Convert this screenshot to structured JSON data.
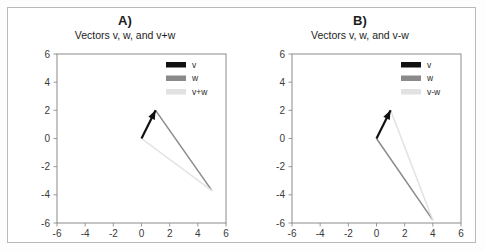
{
  "figure": {
    "background_color": "#ffffff",
    "border_color": "#b9b9b9",
    "panel_count": 2
  },
  "colors": {
    "v": "#111111",
    "w": "#8a8a8a",
    "sum": "#e2e2e2",
    "axis": "#8d8d8d",
    "grid": "#f2f2f2",
    "text": "#1c1c1c"
  },
  "panels": [
    {
      "letter": "A)",
      "title": "Vectors v, w, and v+w",
      "legend": [
        {
          "label": "v",
          "color": "#111111"
        },
        {
          "label": "w",
          "color": "#8a8a8a"
        },
        {
          "label": "v+w",
          "color": "#e2e2e2"
        }
      ],
      "chart_data": {
        "type": "line",
        "title": "Vectors v, w, and v+w",
        "xlabel": "",
        "ylabel": "",
        "xlim": [
          -6,
          6
        ],
        "ylim": [
          -6,
          6
        ],
        "xticks": [
          -6,
          -4,
          -2,
          0,
          2,
          4,
          6
        ],
        "yticks": [
          -6,
          -4,
          -2,
          0,
          2,
          4,
          6
        ],
        "grid": true,
        "legend_position": "upper right",
        "series": [
          {
            "name": "v",
            "color": "#111111",
            "arrow": true,
            "start": [
              0,
              0
            ],
            "end": [
              1,
              2
            ]
          },
          {
            "name": "w",
            "color": "#8a8a8a",
            "arrow": false,
            "start": [
              1,
              2
            ],
            "end": [
              5,
              -3.7
            ]
          },
          {
            "name": "v+w",
            "color": "#e2e2e2",
            "arrow": false,
            "start": [
              0,
              0
            ],
            "end": [
              5,
              -3.7
            ]
          }
        ]
      }
    },
    {
      "letter": "B)",
      "title": "Vectors v, w, and v-w",
      "legend": [
        {
          "label": "v",
          "color": "#111111"
        },
        {
          "label": "w",
          "color": "#8a8a8a"
        },
        {
          "label": "v-w",
          "color": "#e2e2e2"
        }
      ],
      "chart_data": {
        "type": "line",
        "title": "Vectors v, w, and v-w",
        "xlabel": "",
        "ylabel": "",
        "xlim": [
          -6,
          6
        ],
        "ylim": [
          -6,
          6
        ],
        "xticks": [
          -6,
          -4,
          -2,
          0,
          2,
          4,
          6
        ],
        "yticks": [
          -6,
          -4,
          -2,
          0,
          2,
          4,
          6
        ],
        "grid": true,
        "legend_position": "upper right",
        "series": [
          {
            "name": "v",
            "color": "#111111",
            "arrow": true,
            "start": [
              0,
              0
            ],
            "end": [
              1,
              2
            ]
          },
          {
            "name": "w",
            "color": "#8a8a8a",
            "arrow": false,
            "start": [
              0,
              0
            ],
            "end": [
              4,
              -5.8
            ]
          },
          {
            "name": "v-w",
            "color": "#e2e2e2",
            "arrow": false,
            "start": [
              4,
              -5.8
            ],
            "end": [
              1,
              2
            ]
          }
        ]
      }
    }
  ]
}
